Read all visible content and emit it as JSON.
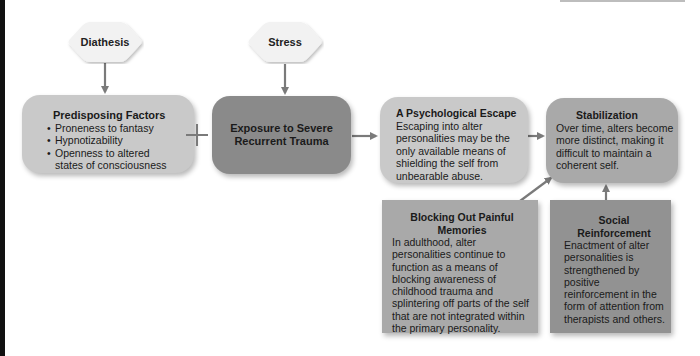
{
  "diagram": {
    "nodes": {
      "diathesis": {
        "label": "Diathesis"
      },
      "stress": {
        "label": "Stress"
      },
      "predisposing": {
        "title": "Predisposing Factors",
        "bullets": [
          "Proneness to fantasy",
          "Hypnotizability",
          "Openness to altered states of consciousness"
        ]
      },
      "plus": {
        "symbol": "+"
      },
      "exposure": {
        "title": "Exposure to Severe Recurrent Trauma"
      },
      "escape": {
        "title": "A Psychological Escape",
        "body": "Escaping into alter personalities may be the only available means of shielding the self from unbearable abuse."
      },
      "stabilization": {
        "title": "Stabilization",
        "body": "Over time, alters become more distinct, making it difficult to maintain a coherent self."
      },
      "blocking": {
        "title": "Blocking Out Painful Memories",
        "body": "In adulthood, alter personalities continue to function as a means of blocking awareness of childhood trauma and splintering off parts of the self that are not integrated within the primary personality."
      },
      "social": {
        "title": "Social Reinforcement",
        "body": "Enactment of alter personalities is strengthened by positive reinforcement in the form of attention from therapists and others."
      }
    },
    "edges": [
      {
        "from": "diathesis",
        "to": "predisposing"
      },
      {
        "from": "stress",
        "to": "exposure"
      },
      {
        "from": "exposure",
        "to": "escape"
      },
      {
        "from": "escape",
        "to": "stabilization"
      },
      {
        "from": "blocking",
        "to": "stabilization"
      },
      {
        "from": "social",
        "to": "stabilization"
      }
    ],
    "colors": {
      "light_box": "#c9c9c9",
      "mid_box": "#a9a9a9",
      "dark_box": "#8a8a8a",
      "arrow": "#7a7a7a",
      "diamond_fill": "#f2f2f2"
    }
  }
}
